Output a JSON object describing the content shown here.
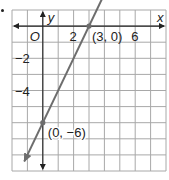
{
  "chart_data": {
    "type": "line",
    "title": "",
    "xlabel": "x",
    "ylabel": "y",
    "xlim": [
      -2,
      8
    ],
    "ylim": [
      -9,
      1
    ],
    "grid": true,
    "origin_label": "O",
    "x_tick_labels": [
      {
        "value": 2,
        "label": "2"
      },
      {
        "value": 6,
        "label": "6"
      }
    ],
    "y_tick_labels": [
      {
        "value": -2,
        "label": "−2"
      },
      {
        "value": -4,
        "label": "−4"
      }
    ],
    "series": [
      {
        "name": "line",
        "equation": "y = 2x - 6",
        "x": [
          -1.2,
          4.1
        ],
        "y": [
          -8.4,
          2.2
        ],
        "color": "#6d6d6d",
        "arrows": "both"
      }
    ],
    "points": [
      {
        "x": 3,
        "y": 0,
        "label": "(3, 0)"
      },
      {
        "x": 0,
        "y": -6,
        "label": "(0, −6)"
      }
    ]
  },
  "colors": {
    "grid": "#a8a8a8",
    "axis": "#222222",
    "line": "#6d6d6d"
  }
}
